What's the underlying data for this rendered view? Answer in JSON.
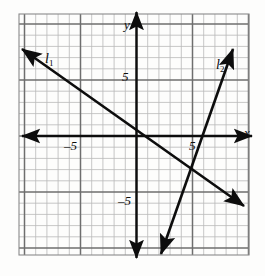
{
  "figure": {
    "background_color": "#fdfdfc",
    "ink_color": "#0d0d0d",
    "minor_grid_color": "#b9b9b9",
    "major_grid_color": "#6e6e6e",
    "border_color": "#8a8a8a"
  },
  "grid": {
    "left_px": 19,
    "top_px": 14,
    "right_px": 249,
    "bottom_px": 255,
    "unit_px": 11.2,
    "origin_x_px": 136.5,
    "origin_y_px": 136,
    "x_min": -10.5,
    "x_max": 10.0,
    "y_min": -10.6,
    "y_max": 10.9,
    "minor_step": 1,
    "major_step": 5,
    "show_minor": true,
    "show_major": true
  },
  "axes": {
    "x_label": "x",
    "y_label": "y",
    "x_label_pos": {
      "x": 244,
      "y": 126
    },
    "y_label_pos": {
      "x": 124,
      "y": 18
    },
    "arrowheads": "both-ends-both-axes"
  },
  "ticks": [
    {
      "name": "y-tick-positive-five",
      "text": "5",
      "x": 122,
      "y": 70
    },
    {
      "name": "y-tick-negative-five",
      "text": "–5",
      "x": 118,
      "y": 194
    },
    {
      "name": "x-tick-negative-five",
      "text": "–5",
      "x": 64,
      "y": 139
    },
    {
      "name": "x-tick-positive-five",
      "text": "5",
      "x": 189,
      "y": 139
    }
  ],
  "lines": [
    {
      "id": "l1",
      "label": "l",
      "subscript": "1",
      "label_pos": {
        "x": 45,
        "y": 52
      },
      "color": "#0d0d0d",
      "stroke_width": 2.6,
      "x1": 22,
      "y1": 49,
      "x2": 244,
      "y2": 206,
      "slope": -0.71,
      "y_intercept": 1.25,
      "arrow_start": true,
      "arrow_end": true
    },
    {
      "id": "l2",
      "label": "l",
      "subscript": "2",
      "label_pos": {
        "x": 216,
        "y": 58
      },
      "color": "#0d0d0d",
      "stroke_width": 2.6,
      "x1": 161,
      "y1": 254,
      "x2": 233,
      "y2": 49,
      "slope": 2.85,
      "y_intercept": -8.0,
      "arrow_start": true,
      "arrow_end": true
    }
  ],
  "chart_data": {
    "type": "line",
    "title": "",
    "xlabel": "x",
    "ylabel": "y",
    "xlim": [
      -10.5,
      10
    ],
    "ylim": [
      -10.6,
      10.9
    ],
    "grid": true,
    "legend": "inline-labels",
    "series": [
      {
        "name": "l₁",
        "label": "l1",
        "slope": -0.71,
        "intercept": 1.25,
        "points": [
          [
            -10.3,
            7.8
          ],
          [
            10.0,
            -6.25
          ]
        ]
      },
      {
        "name": "l₂",
        "label": "l2",
        "slope": 2.85,
        "intercept": -8.0,
        "points": [
          [
            2.2,
            -10.55
          ],
          [
            8.6,
            7.8
          ]
        ]
      }
    ],
    "intersection": [
      4.3,
      -1.8
    ],
    "xticks": [
      -5,
      5
    ],
    "yticks": [
      -5,
      5
    ],
    "xtick_labels": [
      "–5",
      "5"
    ],
    "ytick_labels": [
      "–5",
      "5"
    ]
  }
}
